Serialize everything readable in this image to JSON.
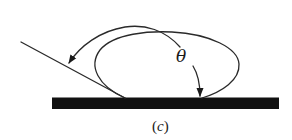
{
  "figure": {
    "type": "contact-angle-diagram",
    "caption_open": "(",
    "caption_letter": "c",
    "caption_close": ")",
    "angle_symbol": "θ",
    "elements": [
      "substrate",
      "droplet",
      "tangent-line",
      "angle-arrow-outer",
      "angle-arrow-inner"
    ],
    "colors": {
      "substrate": "#111111",
      "line": "#2a2a2a",
      "background": "#ffffff"
    }
  }
}
